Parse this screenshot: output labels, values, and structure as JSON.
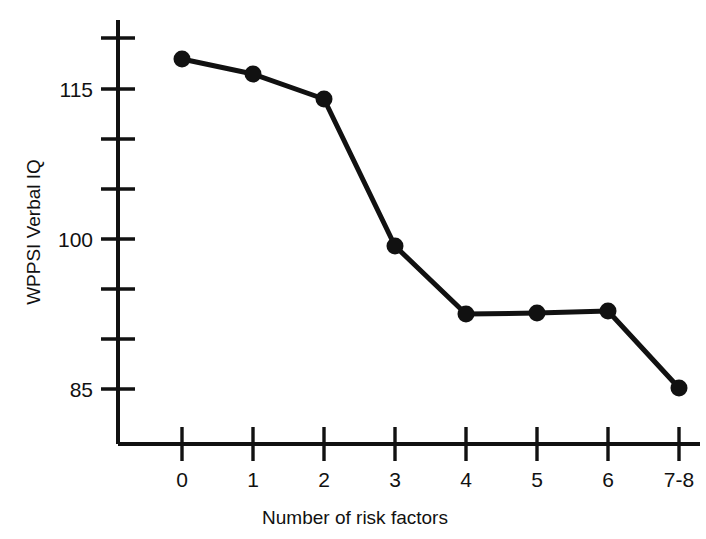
{
  "chart_data": {
    "type": "line",
    "title": "",
    "xlabel": "Number of risk factors",
    "ylabel": "WPPSI Verbal IQ",
    "categories": [
      "0",
      "1",
      "2",
      "3",
      "4",
      "5",
      "6",
      "7-8"
    ],
    "values": [
      118.0,
      116.5,
      114.0,
      99.3,
      92.5,
      92.6,
      92.8,
      85.1
    ],
    "x_tick_labels": [
      "0",
      "1",
      "2",
      "3",
      "4",
      "5",
      "6",
      "7-8"
    ],
    "y_tick_labels": [
      "",
      "115",
      "",
      "",
      "100",
      "",
      "",
      "85"
    ],
    "y_major_labels": [
      "115",
      "100",
      "85"
    ],
    "y_tick_values": [
      117.5,
      115,
      110,
      105,
      100,
      95,
      90,
      85
    ],
    "ylim": [
      81,
      119.5
    ],
    "grid": false,
    "legend": null,
    "marker": "filled-circle",
    "line_color": "#111111",
    "marker_color": "#111111",
    "background_color": "#ffffff"
  },
  "axes": {
    "y_axis_label": "WPPSI Verbal IQ",
    "x_axis_label": "Number of risk factors"
  },
  "labels": {
    "y_115": "115",
    "y_100": "100",
    "y_85": "85",
    "x_0": "0",
    "x_1": "1",
    "x_2": "2",
    "x_3": "3",
    "x_4": "4",
    "x_5": "5",
    "x_6": "6",
    "x_7": "7-8"
  }
}
